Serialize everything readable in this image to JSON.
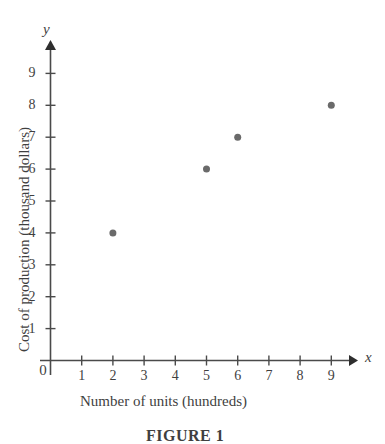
{
  "figure": {
    "caption": "FIGURE 1",
    "background_color": "#ffffff",
    "axis_color": "#4a4a4a",
    "point_color": "#6a6a6a"
  },
  "chart_data": {
    "type": "scatter",
    "title": "",
    "subtitle": "",
    "xlabel": "Number of units (hundreds)",
    "ylabel": "Cost of production (thousand dollars)",
    "x_axis_variable": "x",
    "y_axis_variable": "y",
    "origin_label": "0",
    "xlim": [
      0,
      9.6
    ],
    "ylim": [
      0,
      9.6
    ],
    "x_ticks": [
      1,
      2,
      3,
      4,
      5,
      6,
      7,
      8,
      9
    ],
    "y_ticks": [
      1,
      2,
      3,
      4,
      5,
      6,
      7,
      8,
      9
    ],
    "x_tick_labels": [
      "1",
      "2",
      "3",
      "4",
      "5",
      "6",
      "7",
      "8",
      "9"
    ],
    "y_tick_labels": [
      "1",
      "2",
      "3",
      "4",
      "5",
      "6",
      "7",
      "8",
      "9"
    ],
    "grid": false,
    "legend": null,
    "x": [
      2,
      5,
      6,
      9
    ],
    "y": [
      4,
      6,
      7,
      8
    ],
    "points": [
      {
        "x": 2,
        "y": 4
      },
      {
        "x": 5,
        "y": 6
      },
      {
        "x": 6,
        "y": 7
      },
      {
        "x": 9,
        "y": 8
      }
    ],
    "marker": "circle",
    "marker_color": "#6a6a6a",
    "marker_size": 7
  }
}
